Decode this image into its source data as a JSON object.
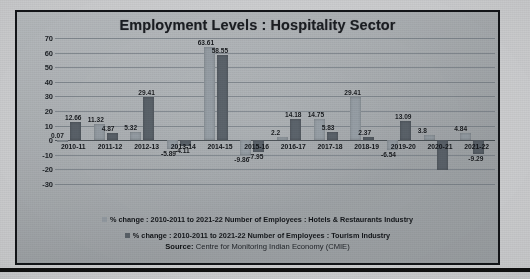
{
  "chart_data": {
    "type": "bar",
    "title": "Employment Levels : Hospitality Sector",
    "xlabel": "",
    "ylabel": "",
    "ylim": [
      -30,
      70
    ],
    "yticks": [
      70,
      60,
      50,
      40,
      30,
      20,
      10,
      0,
      -10,
      -20,
      -30
    ],
    "ytick_labels": [
      "70",
      "60",
      "50",
      "40",
      "30",
      "20",
      "10",
      "0",
      "-10",
      "-20",
      "-30"
    ],
    "grid": true,
    "legend_position": "bottom",
    "categories": [
      "2010-11",
      "2011-12",
      "2012-13",
      "2013-14",
      "2014-15",
      "2015-16",
      "2016-17",
      "2017-18",
      "2018-19",
      "2019-20",
      "2020-21",
      "2021-22"
    ],
    "series": [
      {
        "name": "% change : 2010-2011 to 2021-22 Number of Employees : Hotels & Restaurants Industry",
        "color": "#9aa2a9",
        "values": [
          0.07,
          11.32,
          5.32,
          -5.89,
          63.61,
          -9.86,
          2.2,
          14.75,
          29.41,
          -6.54,
          3.8,
          4.84
        ],
        "labels": [
          "0.07",
          "11.32",
          "5.32",
          "-5.89",
          "63.61",
          "-9.86",
          "2.2",
          "14.75",
          "29.41",
          "-6.54",
          "3.8",
          "4.84"
        ]
      },
      {
        "name": "% change : 2010-2011 to 2021-22 Number of Employees : Tourism Industry",
        "color": "#5d656d",
        "values": [
          12.66,
          4.87,
          29.41,
          -4.11,
          58.55,
          -7.95,
          14.18,
          5.83,
          2.37,
          13.09,
          -20.5,
          -9.29
        ],
        "labels": [
          "12.66",
          "4.87",
          "29.41",
          "-4.11",
          "58.55",
          "-7.95",
          "14.18",
          "5.83",
          "2.37",
          "13.09",
          "",
          "-9.29"
        ]
      }
    ],
    "source_prefix": "Source:",
    "source_text": "Centre for Monitoring Indian Economy (CMIE)"
  },
  "legend": {
    "items": [
      {
        "label": "% change : 2010-2011 to 2021-22 Number of Employees : Hotels & Restaurants Industry"
      },
      {
        "label": "% change : 2010-2011 to 2021-22 Number of Employees : Tourism Industry"
      }
    ]
  }
}
